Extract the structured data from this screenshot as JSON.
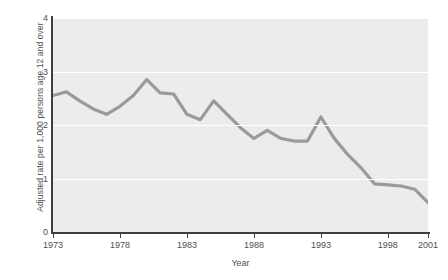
{
  "chart_data": {
    "type": "line",
    "title": "",
    "xlabel": "Year",
    "ylabel": "Adjusted rate per 1,000 persons age 12 and over",
    "xlim": [
      1973,
      2001
    ],
    "ylim": [
      0,
      4
    ],
    "xticks": [
      1973,
      1978,
      1983,
      1988,
      1993,
      1998,
      2001
    ],
    "xtick_labels": [
      "1973",
      "1978",
      "1983",
      "1988",
      "1993",
      "1998",
      "2001"
    ],
    "yticks": [
      0,
      1,
      2,
      3,
      4
    ],
    "ytick_labels": [
      "0",
      "1",
      "2",
      "3",
      "4"
    ],
    "grid": "horizontal",
    "legend": "none",
    "line_color": "#9a9a9a",
    "plot_background": "#ececec",
    "gridline_color": "#ffffff",
    "axis_color": "#3f3f3f",
    "x": [
      1973,
      1974,
      1975,
      1976,
      1977,
      1978,
      1979,
      1980,
      1981,
      1982,
      1983,
      1984,
      1985,
      1986,
      1987,
      1988,
      1989,
      1990,
      1991,
      1992,
      1993,
      1994,
      1995,
      1996,
      1997,
      1998,
      1999,
      2000,
      2001
    ],
    "values": [
      2.55,
      2.62,
      2.45,
      2.3,
      2.2,
      2.35,
      2.55,
      2.85,
      2.6,
      2.58,
      2.2,
      2.1,
      2.45,
      2.2,
      1.95,
      1.75,
      1.9,
      1.75,
      1.7,
      1.7,
      2.15,
      1.75,
      1.45,
      1.2,
      0.9,
      0.88,
      0.86,
      0.8,
      0.55
    ]
  },
  "axis": {
    "y_title": "Adjusted rate per 1,000 persons age 12 and over",
    "x_title": "Year"
  }
}
